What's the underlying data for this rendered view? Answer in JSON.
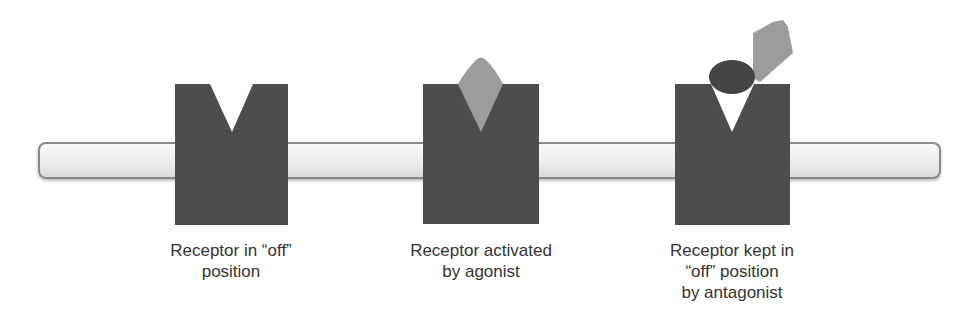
{
  "colors": {
    "receptor": "#4d4d4d",
    "ligand_light": "#9c9c9c",
    "antagonist_dark": "#454545",
    "membrane_fill_top": "#f7f7f7",
    "membrane_fill_bottom": "#dcdcdc",
    "membrane_border": "#8a8a8a",
    "text": "#333333"
  },
  "membrane": {
    "label": "cell membrane"
  },
  "panels": [
    {
      "id": "off",
      "label": "Receptor in “off”\nposition"
    },
    {
      "id": "agonist",
      "label": "Receptor activated\nby agonist"
    },
    {
      "id": "antagonist",
      "label": "Receptor kept in\n“off” position\nby antagonist"
    }
  ]
}
